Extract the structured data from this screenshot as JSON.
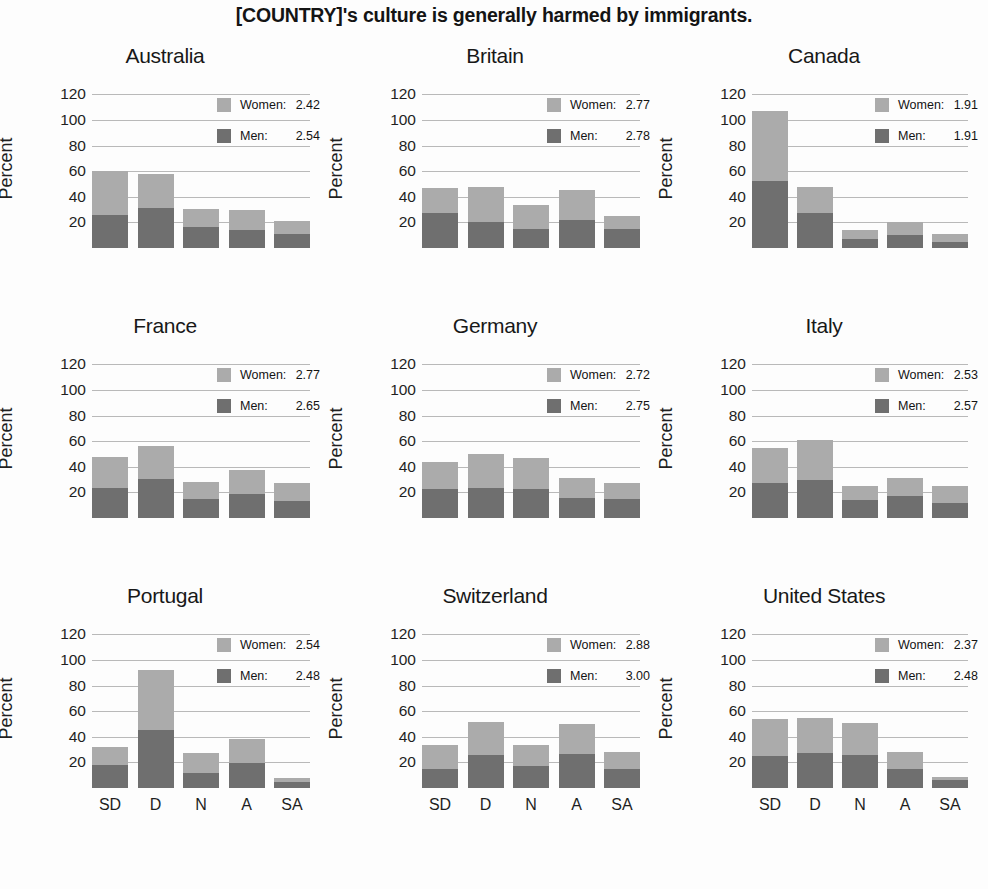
{
  "title": "[COUNTRY]'s culture is generally harmed by immigrants.",
  "axis": {
    "ylabel": "Percent",
    "yticks": [
      "120",
      "100",
      "80",
      "60",
      "40",
      "20"
    ],
    "xticks": [
      "SD",
      "D",
      "N",
      "A",
      "SA"
    ]
  },
  "legend": {
    "women_label": "Women:",
    "men_label": "Men:"
  },
  "colors": {
    "women": "#ababab",
    "men": "#6f6f6f",
    "gridline": "#b9b9b9",
    "text": "#1a1a1a",
    "background": "#fdfdfd"
  },
  "chart_data": {
    "type": "bar",
    "title": "[COUNTRY]'s culture is generally harmed by immigrants.",
    "xlabel": "",
    "ylabel": "Percent",
    "ylim": [
      0,
      125
    ],
    "yticks": [
      20,
      40,
      60,
      80,
      100,
      120
    ],
    "grid": true,
    "stacked": true,
    "legend_position": "top-right inside each panel",
    "categories": [
      "SD",
      "D",
      "N",
      "A",
      "SA"
    ],
    "series_names": [
      "Men",
      "Women"
    ],
    "panels": [
      {
        "name": "Australia",
        "men_mean": "2.54",
        "women_mean": "2.42",
        "series": [
          {
            "name": "Men",
            "values": [
              26,
              31,
              16.5,
              14,
              11
            ]
          },
          {
            "name": "Women",
            "values": [
              34,
              27,
              14,
              15.5,
              10
            ]
          }
        ],
        "totals": [
          60,
          58,
          30.5,
          29.5,
          21
        ]
      },
      {
        "name": "Britain",
        "men_mean": "2.78",
        "women_mean": "2.77",
        "series": [
          {
            "name": "Men",
            "values": [
              27,
              20.5,
              15,
              21.5,
              15
            ]
          },
          {
            "name": "Women",
            "values": [
              20,
              27.5,
              19,
              24,
              10
            ]
          }
        ],
        "totals": [
          47,
          48,
          34,
          45.5,
          25
        ]
      },
      {
        "name": "Canada",
        "men_mean": "1.91",
        "women_mean": "1.91",
        "series": [
          {
            "name": "Men",
            "values": [
              52,
              27,
              7,
              10,
              5
            ]
          },
          {
            "name": "Women",
            "values": [
              55,
              20.5,
              7,
              10,
              6
            ]
          }
        ],
        "totals": [
          107,
          47.5,
          14,
          20,
          11
        ]
      },
      {
        "name": "France",
        "men_mean": "2.65",
        "women_mean": "2.77",
        "series": [
          {
            "name": "Men",
            "values": [
              23.5,
              30.5,
              15,
              18.5,
              13
            ]
          },
          {
            "name": "Women",
            "values": [
              24.5,
              25.5,
              13.5,
              19,
              14
            ]
          }
        ],
        "totals": [
          48,
          56,
          28.5,
          37.5,
          27
        ]
      },
      {
        "name": "Germany",
        "men_mean": "2.75",
        "women_mean": "2.72",
        "series": [
          {
            "name": "Men",
            "values": [
              23,
              23.5,
              23,
              15.5,
              14.5
            ]
          },
          {
            "name": "Women",
            "values": [
              21,
              26.5,
              23.5,
              15.5,
              12.5
            ]
          }
        ],
        "totals": [
          44,
          50,
          46.5,
          31,
          27
        ]
      },
      {
        "name": "Italy",
        "men_mean": "2.57",
        "women_mean": "2.53",
        "series": [
          {
            "name": "Men",
            "values": [
              27,
              30,
              14,
              17.5,
              12
            ]
          },
          {
            "name": "Women",
            "values": [
              28,
              31,
              11,
              13.5,
              13
            ]
          }
        ],
        "totals": [
          55,
          61,
          25,
          31,
          25
        ]
      },
      {
        "name": "Portugal",
        "men_mean": "2.48",
        "women_mean": "2.54",
        "series": [
          {
            "name": "Men",
            "values": [
              18,
              45,
              12,
              19.5,
              5
            ]
          },
          {
            "name": "Women",
            "values": [
              14,
              47,
              15,
              18.5,
              3
            ]
          }
        ],
        "totals": [
          32,
          92,
          27,
          38,
          8
        ]
      },
      {
        "name": "Switzerland",
        "men_mean": "3.00",
        "women_mean": "2.88",
        "series": [
          {
            "name": "Men",
            "values": [
              15,
              26,
              17,
              26.5,
              14.5
            ]
          },
          {
            "name": "Women",
            "values": [
              19,
              25.5,
              17,
              23.5,
              13.5
            ]
          }
        ],
        "totals": [
          34,
          51.5,
          34,
          50,
          28
        ]
      },
      {
        "name": "United States",
        "men_mean": "2.48",
        "women_mean": "2.37",
        "series": [
          {
            "name": "Men",
            "values": [
              25,
              27,
              26,
              15,
              6
            ]
          },
          {
            "name": "Women",
            "values": [
              29,
              27.5,
              25,
              13,
              3
            ]
          }
        ],
        "totals": [
          54,
          54.5,
          51,
          28,
          9
        ]
      }
    ]
  }
}
